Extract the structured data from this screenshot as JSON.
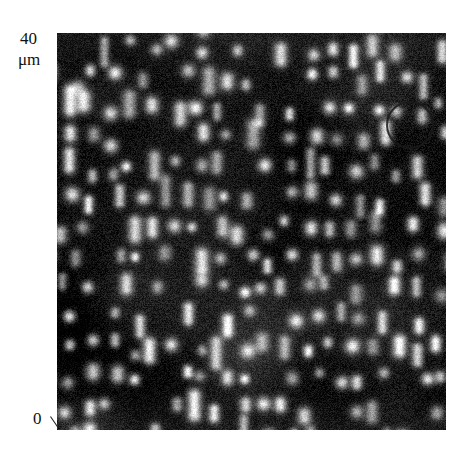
{
  "figure": {
    "type": "micrograph",
    "modality": "scanning-probe-grayscale-image",
    "background": "#ffffff",
    "panel": {
      "x": 57,
      "y": 33,
      "width": 389,
      "height": 397,
      "base_color": "#0d0d0d",
      "feature_color": "#e8e8e8"
    }
  },
  "axis": {
    "top_value": "40",
    "top_unit": "μm",
    "bottom_value": "0",
    "scale_span_um": 40,
    "orientation": "vertical-left",
    "tick_marks": [
      "0"
    ]
  },
  "annotations": [
    {
      "name": "highlight-circle",
      "shape": "circle",
      "cx": 353,
      "cy": 92,
      "r": 23,
      "stroke": "#1a1a1a",
      "stroke_width": 2,
      "fill": "none"
    }
  ],
  "image_content": {
    "description": "Dark noisy background populated by bright vertical capsule-shaped features arranged on a quasi-periodic lattice.",
    "feature_shape": "vertical-capsule",
    "column_pitch_px": 22,
    "row_pitch_px": 30,
    "feature_width_px": 11,
    "feature_length_range_px": [
      9,
      36
    ],
    "noise_amplitude": 42,
    "seed": 20240517
  },
  "chart_data": {
    "type": "heatmap",
    "title": "",
    "xlabel": "",
    "ylabel": "μm",
    "ylim": [
      0,
      40
    ],
    "tick_labels_y": [
      "0",
      "40"
    ],
    "grid": false,
    "legend": "none",
    "colormap": "grayscale",
    "value_range": [
      0,
      255
    ]
  }
}
